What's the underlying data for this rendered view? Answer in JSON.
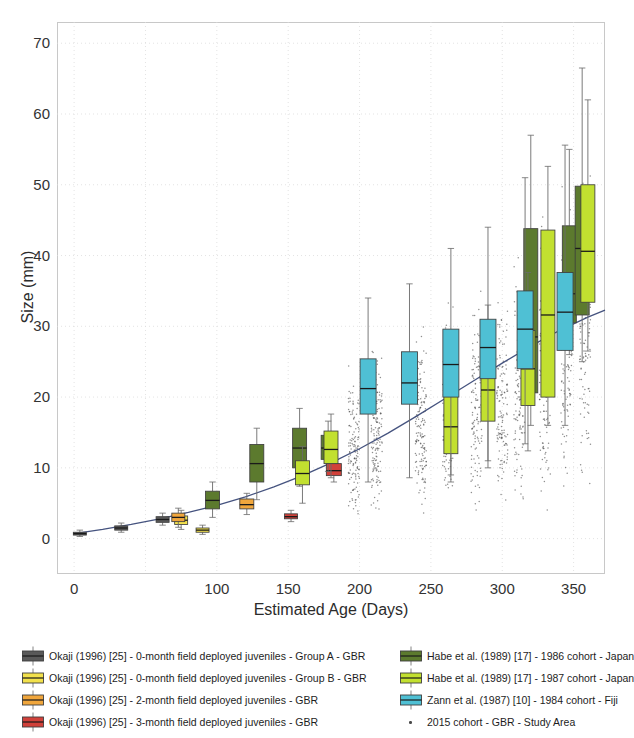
{
  "axes": {
    "xlabel": "Estimated Age (Days)",
    "ylabel": "Size (mm)",
    "xticks": [
      "0",
      "",
      "100",
      "150",
      "200",
      "250",
      "300",
      "350"
    ],
    "xtick_values": [
      0,
      50,
      100,
      150,
      200,
      250,
      300,
      350
    ],
    "yticks": [
      "0",
      "10",
      "20",
      "30",
      "40",
      "50",
      "60",
      "70"
    ],
    "ytick_values": [
      0,
      10,
      20,
      30,
      40,
      50,
      60,
      70
    ]
  },
  "legend": {
    "left": [
      {
        "label": "Okaji (1996) [25] - 0-month field deployed juveniles - Group A - GBR",
        "color": "#595959",
        "icon": "box-swatch"
      },
      {
        "label": "Okaji (1996) [25] - 0-month field deployed juveniles - Group B - GBR",
        "color": "#f2e14c",
        "icon": "box-swatch"
      },
      {
        "label": "Okaji (1996) [25] - 2-month field deployed juveniles - GBR",
        "color": "#f0a63c",
        "icon": "box-swatch"
      },
      {
        "label": "Okaji (1996) [25] - 3-month field deployed juveniles - GBR",
        "color": "#d1413a",
        "icon": "box-swatch"
      }
    ],
    "right": [
      {
        "label": "Habe et al. (1989) [17] - 1986 cohort - Japan",
        "color": "#5c7a2e",
        "icon": "box-swatch"
      },
      {
        "label": "Habe et al. (1989) [17] - 1987 cohort - Japan",
        "color": "#c2e030",
        "icon": "box-swatch"
      },
      {
        "label": "Zann et al. (1987) [10] - 1984 cohort - Fiji",
        "color": "#4fc0d4",
        "icon": "box-swatch"
      },
      {
        "label": "2015 cohort - GBR - Study Area",
        "color": "#4a4a4a",
        "icon": "scatter-dot"
      }
    ]
  },
  "chart_data": {
    "type": "box",
    "title": "",
    "xlabel": "Estimated Age (Days)",
    "ylabel": "Size (mm)",
    "xlim": [
      -12,
      372
    ],
    "ylim": [
      -5,
      73
    ],
    "grid": true,
    "legend_position": "below",
    "colors": {
      "okaji_0m_a": "#595959",
      "okaji_0m_b": "#f2e14c",
      "okaji_2m": "#f0a63c",
      "okaji_3m": "#d1413a",
      "habe_1986": "#5c7a2e",
      "habe_1987": "#c2e030",
      "zann_1984": "#4fc0d4",
      "cohort_2015": "#4a4a4a",
      "fit_line": "#3b4a78"
    },
    "series": [
      {
        "name": "Okaji (1996) [25] - 0-month field deployed juveniles - Group A - GBR",
        "color": "#595959",
        "boxes": [
          {
            "x": 4,
            "low": 0.3,
            "q1": 0.5,
            "median": 0.7,
            "q3": 0.9,
            "high": 1.2,
            "width": 13
          },
          {
            "x": 33,
            "low": 0.9,
            "q1": 1.2,
            "median": 1.5,
            "q3": 1.8,
            "high": 2.2,
            "width": 13
          },
          {
            "x": 62,
            "low": 1.9,
            "q1": 2.3,
            "median": 2.7,
            "q3": 3.1,
            "high": 3.6,
            "width": 13
          }
        ]
      },
      {
        "name": "Okaji (1996) [25] - 0-month field deployed juveniles - Group B - GBR",
        "color": "#f2e14c",
        "boxes": [
          {
            "x": 75,
            "low": 1.3,
            "q1": 2.0,
            "median": 2.6,
            "q3": 3.2,
            "high": 4.0,
            "width": 13
          },
          {
            "x": 90,
            "low": 0.6,
            "q1": 0.9,
            "median": 1.2,
            "q3": 1.5,
            "high": 1.9,
            "width": 13
          }
        ]
      },
      {
        "name": "Okaji (1996) [25] - 2-month field deployed juveniles - GBR",
        "color": "#f0a63c",
        "boxes": [
          {
            "x": 73,
            "low": 1.6,
            "q1": 2.4,
            "median": 3.0,
            "q3": 3.6,
            "high": 4.3,
            "width": 13
          },
          {
            "x": 121,
            "low": 3.4,
            "q1": 4.2,
            "median": 4.8,
            "q3": 5.6,
            "high": 6.4,
            "width": 14
          }
        ]
      },
      {
        "name": "Okaji (1996) [25] - 3-month field deployed juveniles - GBR",
        "color": "#d1413a",
        "boxes": [
          {
            "x": 152,
            "low": 2.4,
            "q1": 2.8,
            "median": 3.1,
            "q3": 3.5,
            "high": 4.0,
            "width": 13
          },
          {
            "x": 182,
            "low": 8.0,
            "q1": 8.9,
            "median": 9.6,
            "q3": 10.6,
            "high": 11.6,
            "width": 15
          }
        ]
      },
      {
        "name": "Habe et al. (1989) [17] - 1986 cohort - Japan",
        "color": "#5c7a2e",
        "boxes": [
          {
            "x": 97,
            "low": 3.0,
            "q1": 4.2,
            "median": 5.4,
            "q3": 6.7,
            "high": 8.0,
            "width": 14
          },
          {
            "x": 128,
            "low": 5.5,
            "q1": 8.0,
            "median": 10.6,
            "q3": 13.3,
            "high": 15.6,
            "width": 14
          },
          {
            "x": 158,
            "low": 7.4,
            "q1": 10.0,
            "median": 12.8,
            "q3": 15.6,
            "high": 18.4,
            "width": 14
          },
          {
            "x": 178,
            "low": 9.5,
            "q1": 11.2,
            "median": 12.8,
            "q3": 14.6,
            "high": 16.6,
            "width": 14
          },
          {
            "x": 320,
            "low": 16.0,
            "q1": 20.6,
            "median": 28.5,
            "q3": 43.8,
            "high": 57.0,
            "width": 14
          },
          {
            "x": 347,
            "low": 26.0,
            "q1": 30.5,
            "median": 34.6,
            "q3": 44.2,
            "high": 55.0,
            "width": 14
          },
          {
            "x": 356,
            "low": 25.0,
            "q1": 31.6,
            "median": 41.0,
            "q3": 49.8,
            "high": 66.5,
            "width": 14
          }
        ]
      },
      {
        "name": "Habe et al. (1989) [17] - 1987 cohort - Japan",
        "color": "#c2e030",
        "boxes": [
          {
            "x": 160,
            "low": 5.0,
            "q1": 7.6,
            "median": 9.2,
            "q3": 11.0,
            "high": 13.0,
            "width": 14
          },
          {
            "x": 180,
            "low": 8.6,
            "q1": 10.6,
            "median": 12.6,
            "q3": 15.2,
            "high": 17.6,
            "width": 14
          },
          {
            "x": 264,
            "low": 8.0,
            "q1": 12.0,
            "median": 15.8,
            "q3": 20.8,
            "high": 26.0,
            "width": 14
          },
          {
            "x": 290,
            "low": 10.0,
            "q1": 16.6,
            "median": 21.0,
            "q3": 24.6,
            "high": 33.0,
            "width": 14
          },
          {
            "x": 318,
            "low": 12.4,
            "q1": 18.8,
            "median": 24.0,
            "q3": 29.4,
            "high": 37.6,
            "width": 14
          },
          {
            "x": 332,
            "low": 16.0,
            "q1": 20.0,
            "median": 31.6,
            "q3": 43.6,
            "high": 52.6,
            "width": 14
          },
          {
            "x": 360,
            "low": 26.5,
            "q1": 33.4,
            "median": 40.6,
            "q3": 50.0,
            "high": 62.0,
            "width": 14
          }
        ]
      },
      {
        "name": "Zann et al. (1987) [10] - 1984 cohort - Fiji",
        "color": "#4fc0d4",
        "boxes": [
          {
            "x": 206,
            "low": 8.0,
            "q1": 17.6,
            "median": 21.2,
            "q3": 25.4,
            "high": 34.0,
            "width": 16
          },
          {
            "x": 235,
            "low": 8.6,
            "q1": 19.0,
            "median": 22.0,
            "q3": 26.4,
            "high": 36.0,
            "width": 16
          },
          {
            "x": 264,
            "low": 9.0,
            "q1": 20.0,
            "median": 24.6,
            "q3": 29.6,
            "high": 41.0,
            "width": 16
          },
          {
            "x": 290,
            "low": 11.0,
            "q1": 22.6,
            "median": 27.0,
            "q3": 31.0,
            "high": 44.0,
            "width": 16
          },
          {
            "x": 316,
            "low": 13.4,
            "q1": 24.0,
            "median": 29.6,
            "q3": 35.0,
            "high": 51.0,
            "width": 16
          },
          {
            "x": 344,
            "low": 16.0,
            "q1": 26.6,
            "median": 32.0,
            "q3": 37.6,
            "high": 55.6,
            "width": 16
          }
        ]
      }
    ],
    "fit_line": {
      "name": "Fitted growth curve",
      "color": "#3b4a78",
      "points": [
        [
          0,
          0.7
        ],
        [
          20,
          1.3
        ],
        [
          40,
          2.0
        ],
        [
          60,
          2.8
        ],
        [
          80,
          3.7
        ],
        [
          100,
          4.7
        ],
        [
          120,
          5.9
        ],
        [
          140,
          7.3
        ],
        [
          160,
          8.9
        ],
        [
          180,
          10.7
        ],
        [
          200,
          12.7
        ],
        [
          220,
          14.9
        ],
        [
          240,
          17.3
        ],
        [
          260,
          19.8
        ],
        [
          280,
          22.3
        ],
        [
          300,
          24.8
        ],
        [
          320,
          27.2
        ],
        [
          340,
          29.4
        ],
        [
          360,
          31.3
        ],
        [
          372,
          32.3
        ]
      ]
    },
    "scatter": {
      "name": "2015 cohort - GBR - Study Area",
      "color": "#4a4a4a",
      "description": "Dense vertical point clouds of individual measurements at sampling dates",
      "clusters": [
        {
          "x": 196,
          "n": 140,
          "ymin": 2.0,
          "ymax": 26.0,
          "ycenter": 11.0
        },
        {
          "x": 212,
          "n": 150,
          "ymin": 2.5,
          "ymax": 30.0,
          "ycenter": 12.5
        },
        {
          "x": 243,
          "n": 150,
          "ymin": 3.0,
          "ymax": 33.0,
          "ycenter": 14.5
        },
        {
          "x": 262,
          "n": 140,
          "ymin": 3.5,
          "ymax": 36.0,
          "ycenter": 16.0
        },
        {
          "x": 282,
          "n": 120,
          "ymin": 2.0,
          "ymax": 39.0,
          "ycenter": 17.5
        },
        {
          "x": 300,
          "n": 130,
          "ymin": 2.5,
          "ymax": 42.0,
          "ycenter": 19.5
        },
        {
          "x": 312,
          "n": 120,
          "ymin": 3.0,
          "ymax": 45.0,
          "ycenter": 21.0
        },
        {
          "x": 330,
          "n": 130,
          "ymin": 3.0,
          "ymax": 52.0,
          "ycenter": 23.0
        },
        {
          "x": 345,
          "n": 120,
          "ymin": 4.0,
          "ymax": 56.0,
          "ycenter": 25.0
        },
        {
          "x": 358,
          "n": 110,
          "ymin": 5.0,
          "ymax": 60.0,
          "ycenter": 27.0
        }
      ]
    }
  }
}
